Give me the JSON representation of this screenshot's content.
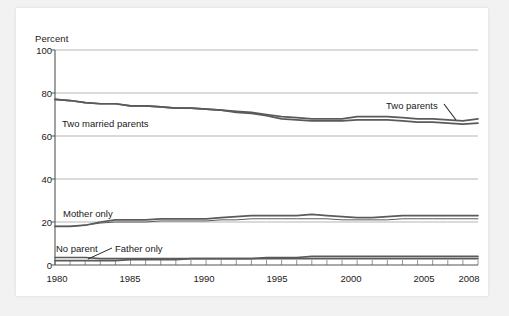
{
  "chart_data": {
    "type": "line",
    "title": "",
    "xlabel": "",
    "ylabel": "Percent",
    "xlim": [
      1980,
      2008
    ],
    "ylim": [
      0,
      100
    ],
    "ytick_labels": [
      "0",
      "20",
      "40",
      "60",
      "80",
      "100"
    ],
    "ytick_values": [
      0,
      20,
      40,
      60,
      80,
      100
    ],
    "xtick_labels": [
      "1980",
      "1985",
      "1990",
      "1995",
      "2000",
      "2005",
      "2008"
    ],
    "xtick_values": [
      1980,
      1985,
      1990,
      1995,
      2000,
      2005,
      2008
    ],
    "minor_xticks": "every year 1980-2008",
    "grid": "horizontal gridlines at 20, 40, 60, 80, 100",
    "legend_position": "inline annotations on plot",
    "line_color": "#5a5a5a",
    "grid_color": "#b5b5b5",
    "axis_color": "#555555",
    "x": [
      1980,
      1981,
      1982,
      1983,
      1984,
      1985,
      1986,
      1987,
      1988,
      1989,
      1990,
      1991,
      1992,
      1993,
      1994,
      1995,
      1996,
      1997,
      1998,
      1999,
      2000,
      2001,
      2002,
      2003,
      2004,
      2005,
      2006,
      2007,
      2008
    ],
    "series": [
      {
        "name": "Two parents",
        "label": "Two parents",
        "label_position": "upper-right with leader line",
        "values": [
          77,
          76.5,
          75.5,
          75,
          75,
          74,
          74,
          73.5,
          73,
          73,
          72.5,
          72,
          71.5,
          71,
          70,
          69,
          68.5,
          68,
          68,
          68,
          69,
          69,
          69,
          68.5,
          68,
          68,
          67.5,
          67,
          68
        ]
      },
      {
        "name": "Two married parents",
        "label": "Two married parents",
        "label_position": "left of plot under line",
        "values": [
          77,
          76.5,
          75.5,
          75,
          75,
          74,
          74,
          73.5,
          73,
          73,
          72.5,
          72,
          71,
          70.5,
          69.5,
          68,
          67.5,
          67,
          67,
          67,
          67.5,
          67.5,
          67.5,
          67,
          66.5,
          66.5,
          66,
          65.5,
          66
        ]
      },
      {
        "name": "Mother only",
        "label": "Mother only",
        "label_position": "left of plot above line",
        "values": [
          18,
          18,
          18.5,
          20,
          21,
          21,
          21,
          21.5,
          21.5,
          21.5,
          21.5,
          22,
          22.5,
          23,
          23,
          23,
          23,
          23.5,
          23,
          22.5,
          22,
          22,
          22.5,
          23,
          23,
          23,
          23,
          23,
          23
        ]
      },
      {
        "name": "Mother only (secondary)",
        "label": "",
        "label_position": "",
        "values": [
          18,
          18,
          18.5,
          19.5,
          20,
          20,
          20,
          20.5,
          20.5,
          20.5,
          20.5,
          21,
          21,
          21.5,
          21.5,
          21.5,
          21.5,
          21.5,
          21.5,
          21,
          21,
          21,
          21,
          21.5,
          21.5,
          21.5,
          21.5,
          21.5,
          21.5
        ]
      },
      {
        "name": "Father only",
        "label": "Father only",
        "label_position": "lower-left inline",
        "values": [
          2,
          2,
          2,
          2,
          2,
          2.5,
          2.5,
          2.5,
          2.5,
          3,
          3,
          3,
          3,
          3,
          3.5,
          3.5,
          3.5,
          4,
          4,
          4,
          4,
          4,
          4,
          4,
          4,
          4,
          4,
          4,
          4
        ]
      },
      {
        "name": "No parent",
        "label": "No parent",
        "label_position": "lower-left with leader line",
        "values": [
          3.5,
          3.5,
          3.5,
          3,
          3,
          3,
          3,
          3,
          3,
          3,
          3,
          3,
          3,
          3,
          3,
          3,
          3,
          3,
          3,
          3,
          3,
          3,
          3,
          3,
          3,
          3,
          3,
          3,
          3
        ]
      }
    ]
  }
}
